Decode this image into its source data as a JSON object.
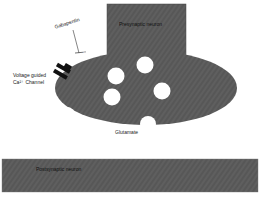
{
  "diagram": {
    "type": "synapse",
    "labels": {
      "presynaptic": "Presynaptic neuron",
      "postsynaptic": "Postsynaptic neuron",
      "gabapentin": "Gabapentin",
      "subunit": "α2δ subunit",
      "channel_line1": "Voltage guided",
      "channel_line2": "Ca²⁺ Channel",
      "glutamate": "Glutamate"
    },
    "colors": {
      "neuron_fill": "#5f5f5f",
      "vesicle_fill": "#ffffff",
      "channel_fill": "#111111",
      "background": "#ffffff"
    },
    "vesicles": [
      {
        "cx": 116,
        "cy": 76,
        "r": 9
      },
      {
        "cx": 145,
        "cy": 66,
        "r": 9
      },
      {
        "cx": 162,
        "cy": 91,
        "r": 9
      },
      {
        "cx": 111,
        "cy": 97,
        "r": 9
      }
    ]
  }
}
